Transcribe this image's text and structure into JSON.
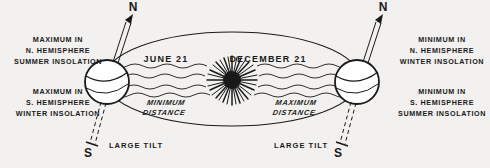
{
  "figure": {
    "background_color": "#f2f1ef",
    "ink_color": "#1a1a1a"
  },
  "annotations": {
    "left_top_block": {
      "line1": "MAXIMUM  IN",
      "line2": "N. HEMISPHERE",
      "line3": "SUMMER INSOLATION"
    },
    "left_bottom_block": {
      "line1": "MAXIMUM  IN",
      "line2": "S. HEMISPHERE",
      "line3": "WINTER INSOLATION"
    },
    "right_top_block": {
      "line1": "MINIMUM  IN",
      "line2": "N. HEMISPHERE",
      "line3": "WINTER INSOLATION"
    },
    "right_bottom_block": {
      "line1": "MINIMUM  IN",
      "line2": "S. HEMISPHERE",
      "line3": "SUMMER INSOLATION"
    }
  },
  "seasons": {
    "left": "JUNE 21",
    "right": "DECEMBER 21"
  },
  "distances": {
    "left_line1": "MINIMUM",
    "left_line2": "DISTANCE",
    "right_line1": "MAXIMUM",
    "right_line2": "DISTANCE"
  },
  "poles": {
    "left_north": "N",
    "left_south": "S",
    "right_north": "N",
    "right_south": "S"
  },
  "tilt_labels": {
    "left": "LARGE  TILT",
    "right": "LARGE  TILT"
  },
  "icons": {
    "sun": "sun-burst-icon",
    "left_earth": "earth-sphere-icon",
    "right_earth": "earth-sphere-icon",
    "orbit": "orbit-ellipse-icon",
    "left_axis": "tilt-axis-icon",
    "right_axis": "tilt-axis-icon",
    "rays": "insolation-ray-icon"
  }
}
